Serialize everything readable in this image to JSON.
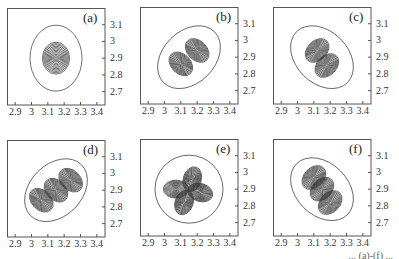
{
  "chart_data": [
    {
      "type": "contour",
      "panel_label": "(a)",
      "description": "Single-lobe ground-state-like density; concentric ellipses centered near (3.15, 2.9)",
      "xticks": [
        "2.9",
        "3",
        "3.1",
        "3.2",
        "3.3",
        "3.4"
      ],
      "yticks": [
        "3.1",
        "3",
        "2.9",
        "2.8",
        "2.7"
      ],
      "xlim": [
        2.85,
        3.45
      ],
      "ylim": [
        2.62,
        3.2
      ],
      "lobes": [
        {
          "x": 3.15,
          "y": 2.9
        }
      ],
      "levels": 12
    },
    {
      "type": "contour",
      "panel_label": "(b)",
      "description": "Two lobes along diagonal with node between",
      "xticks": [
        "2.9",
        "3",
        "3.1",
        "3.2",
        "3.3",
        "3.4"
      ],
      "yticks": [
        "3.1",
        "3",
        "2.9",
        "2.8",
        "2.7"
      ],
      "xlim": [
        2.85,
        3.45
      ],
      "ylim": [
        2.62,
        3.2
      ],
      "lobes": [
        {
          "x": 3.1,
          "y": 2.86
        },
        {
          "x": 3.2,
          "y": 2.94
        }
      ],
      "levels": 12
    },
    {
      "type": "contour",
      "panel_label": "(c)",
      "description": "Two lobes along anti-diagonal with node between",
      "xticks": [
        "2.9",
        "3",
        "3.1",
        "3.2",
        "3.3",
        "3.4"
      ],
      "yticks": [
        "3.1",
        "3",
        "2.9",
        "2.8",
        "2.7"
      ],
      "xlim": [
        2.85,
        3.45
      ],
      "ylim": [
        2.62,
        3.2
      ],
      "lobes": [
        {
          "x": 3.12,
          "y": 2.94
        },
        {
          "x": 3.18,
          "y": 2.85
        }
      ],
      "levels": 12
    },
    {
      "type": "contour",
      "panel_label": "(d)",
      "description": "Three lobes along diagonal with two nodes",
      "xticks": [
        "2.9",
        "3",
        "3.1",
        "3.2",
        "3.3",
        "3.4"
      ],
      "yticks": [
        "3.1",
        "3",
        "2.9",
        "2.8",
        "2.7"
      ],
      "xlim": [
        2.85,
        3.45
      ],
      "ylim": [
        2.62,
        3.2
      ],
      "lobes": [
        {
          "x": 3.06,
          "y": 2.84
        },
        {
          "x": 3.15,
          "y": 2.9
        },
        {
          "x": 3.24,
          "y": 2.96
        }
      ],
      "levels": 12
    },
    {
      "type": "contour",
      "panel_label": "(e)",
      "description": "Four lobes (quadrupole / clover) with crossed nodal lines",
      "xticks": [
        "2.9",
        "3",
        "3.1",
        "3.2",
        "3.3",
        "3.4"
      ],
      "yticks": [
        "3.1",
        "3",
        "2.9",
        "2.8",
        "2.7"
      ],
      "xlim": [
        2.85,
        3.45
      ],
      "ylim": [
        2.62,
        3.2
      ],
      "lobes": [
        {
          "x": 3.17,
          "y": 2.96
        },
        {
          "x": 3.07,
          "y": 2.9
        },
        {
          "x": 3.22,
          "y": 2.88
        },
        {
          "x": 3.12,
          "y": 2.82
        }
      ],
      "levels": 12
    },
    {
      "type": "contour",
      "panel_label": "(f)",
      "description": "Three lobes along anti-diagonal with two nodes",
      "xticks": [
        "2.9",
        "3",
        "3.1",
        "3.2",
        "3.3",
        "3.4"
      ],
      "yticks": [
        "3.1",
        "3",
        "2.9",
        "2.8",
        "2.7"
      ],
      "xlim": [
        2.85,
        3.45
      ],
      "ylim": [
        2.62,
        3.2
      ],
      "lobes": [
        {
          "x": 3.1,
          "y": 2.97
        },
        {
          "x": 3.15,
          "y": 2.9
        },
        {
          "x": 3.2,
          "y": 2.82
        }
      ],
      "levels": 12
    }
  ],
  "panels": [
    {
      "label": "(a)"
    },
    {
      "label": "(b)"
    },
    {
      "label": "(c)"
    },
    {
      "label": "(d)"
    },
    {
      "label": "(e)"
    },
    {
      "label": "(f)"
    }
  ],
  "axis": {
    "xticks": [
      "2.9",
      "3",
      "3.1",
      "3.2",
      "3.3",
      "3.4"
    ],
    "yticks": [
      "3.1",
      "3",
      "2.9",
      "2.8",
      "2.7"
    ]
  },
  "caption": "... (a)-(f) ..."
}
